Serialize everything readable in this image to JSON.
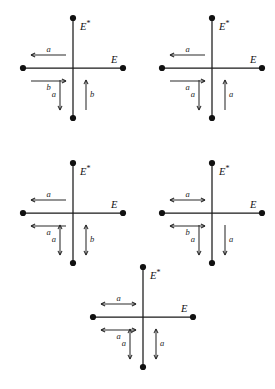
{
  "figure": {
    "background_color": "#ffffff",
    "stroke_color": "#1a1a1a",
    "label_color": "#111111",
    "axis_labels": {
      "vertical": "E",
      "vertical_star": "*",
      "horizontal": "E"
    },
    "diagrams": [
      {
        "id": "diagram-1",
        "position": "top-left",
        "center": [
          73,
          68
        ],
        "arm": 50,
        "vertical_label": "E",
        "vertical_star": "*",
        "horizontal_label": "E",
        "edges": [
          {
            "name": "upper-left-arrow",
            "orientation": "horizontal",
            "side": "upper",
            "direction": "left",
            "heads": 1,
            "label": "a"
          },
          {
            "name": "lower-left-arrow",
            "orientation": "horizontal",
            "side": "lower",
            "direction": "right",
            "heads": 1,
            "label": "b"
          },
          {
            "name": "left-vertical-arrow",
            "orientation": "vertical",
            "side": "left",
            "direction": "down",
            "heads": 1,
            "label": "a"
          },
          {
            "name": "right-vertical-arrow",
            "orientation": "vertical",
            "side": "right",
            "direction": "up",
            "heads": 1,
            "label": "b"
          }
        ]
      },
      {
        "id": "diagram-2",
        "position": "top-right",
        "center": [
          212,
          68
        ],
        "arm": 50,
        "vertical_label": "E",
        "vertical_star": "*",
        "horizontal_label": "E",
        "edges": [
          {
            "name": "upper-left-arrow",
            "orientation": "horizontal",
            "side": "upper",
            "direction": "left",
            "heads": 1,
            "label": "a"
          },
          {
            "name": "lower-left-arrow",
            "orientation": "horizontal",
            "side": "lower",
            "direction": "right",
            "heads": 1,
            "label": "a"
          },
          {
            "name": "left-vertical-arrow",
            "orientation": "vertical",
            "side": "left",
            "direction": "down",
            "heads": 1,
            "label": "a"
          },
          {
            "name": "right-vertical-arrow",
            "orientation": "vertical",
            "side": "right",
            "direction": "up",
            "heads": 1,
            "label": "a"
          }
        ]
      },
      {
        "id": "diagram-3",
        "position": "middle-left",
        "center": [
          73,
          213
        ],
        "arm": 50,
        "vertical_label": "E",
        "vertical_star": "*",
        "horizontal_label": "E",
        "edges": [
          {
            "name": "upper-left-arrow",
            "orientation": "horizontal",
            "side": "upper",
            "direction": "left",
            "heads": 1,
            "label": "a"
          },
          {
            "name": "lower-left-arrow",
            "orientation": "horizontal",
            "side": "lower",
            "direction": "left",
            "heads": 1,
            "label": "a"
          },
          {
            "name": "left-vertical-arrow",
            "orientation": "vertical",
            "side": "left",
            "direction": "both",
            "heads": 2,
            "label": "a"
          },
          {
            "name": "right-vertical-arrow",
            "orientation": "vertical",
            "side": "right",
            "direction": "both",
            "heads": 2,
            "label": "b"
          }
        ]
      },
      {
        "id": "diagram-4",
        "position": "middle-right",
        "center": [
          212,
          213
        ],
        "arm": 50,
        "vertical_label": "E",
        "vertical_star": "*",
        "horizontal_label": "E",
        "edges": [
          {
            "name": "upper-left-arrow",
            "orientation": "horizontal",
            "side": "upper",
            "direction": "both",
            "heads": 2,
            "label": "a"
          },
          {
            "name": "lower-left-arrow",
            "orientation": "horizontal",
            "side": "lower",
            "direction": "both",
            "heads": 2,
            "label": "b"
          },
          {
            "name": "left-vertical-arrow",
            "orientation": "vertical",
            "side": "left",
            "direction": "down",
            "heads": 1,
            "label": "a"
          },
          {
            "name": "right-vertical-arrow",
            "orientation": "vertical",
            "side": "right",
            "direction": "down",
            "heads": 1,
            "label": "a"
          }
        ]
      },
      {
        "id": "diagram-5",
        "position": "bottom-center",
        "center": [
          143,
          317
        ],
        "arm": 50,
        "vertical_label": "E",
        "vertical_star": "*",
        "horizontal_label": "E",
        "edges": [
          {
            "name": "upper-left-arrow",
            "orientation": "horizontal",
            "side": "upper",
            "direction": "both",
            "heads": 2,
            "label": "a"
          },
          {
            "name": "lower-left-arrow",
            "orientation": "horizontal",
            "side": "lower",
            "direction": "both",
            "heads": 2,
            "label": "a"
          },
          {
            "name": "left-vertical-arrow",
            "orientation": "vertical",
            "side": "left",
            "direction": "both",
            "heads": 2,
            "label": "a"
          },
          {
            "name": "right-vertical-arrow",
            "orientation": "vertical",
            "side": "right",
            "direction": "both",
            "heads": 2,
            "label": "a"
          }
        ]
      }
    ]
  }
}
